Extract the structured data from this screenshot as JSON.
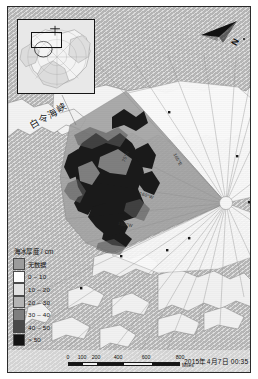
{
  "figure": {
    "kind": "gis-map",
    "title_implicit": "Arctic sea ice thickness map",
    "frame_color": "#2b2b2b",
    "ocean_color": "#b6b6b6"
  },
  "inset": {
    "name": "locator-inset",
    "description": "Arctic overview locator map",
    "box_label": ""
  },
  "north_arrow": {
    "label": "N",
    "icon": "north-arrow-icon"
  },
  "map_labels": {
    "strait": "白令海峡",
    "graticules": [
      {
        "id": "lon-165e",
        "text": "165°E"
      },
      {
        "id": "lon-160w",
        "text": "160°W"
      },
      {
        "id": "lon-155w",
        "text": "155°W"
      },
      {
        "id": "lat-75n",
        "text": "75°N"
      }
    ]
  },
  "legend": {
    "title": "海冰厚度 / cm",
    "items": [
      {
        "label": "无数据",
        "color": "#9c9c9c"
      },
      {
        "label": "0 – 10",
        "color": "#fdfdfd"
      },
      {
        "label": "10 – 20",
        "color": "#e2e2e2"
      },
      {
        "label": "20 – 30",
        "color": "#b4b4b4"
      },
      {
        "label": "30 – 40",
        "color": "#7e7e7e"
      },
      {
        "label": "40 – 50",
        "color": "#4a4a4a"
      },
      {
        "label": "> 50",
        "color": "#141414"
      }
    ]
  },
  "scalebar": {
    "ticks": [
      "0",
      "100",
      "200",
      "400",
      "600",
      "800"
    ],
    "unit": "Miles"
  },
  "timestamp": "2015年4月7日 00:35"
}
